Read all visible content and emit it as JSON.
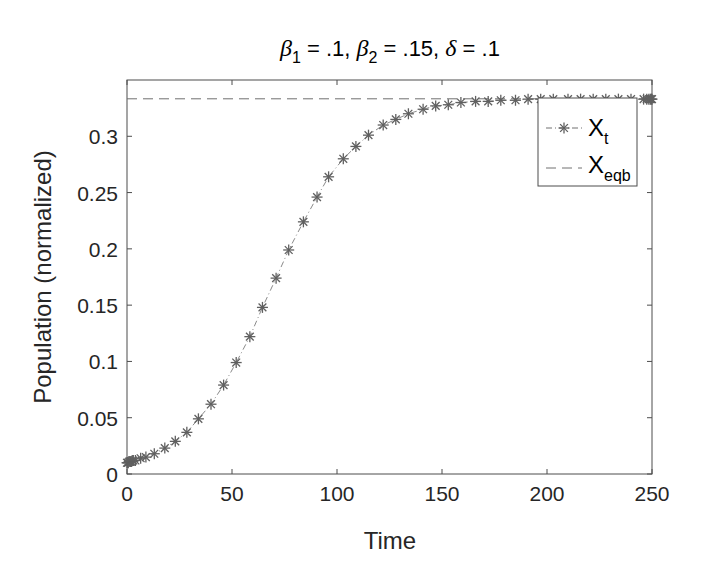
{
  "chart_data": {
    "type": "line",
    "title": "β1 = .1, β2 = .15, δ = .1",
    "title_parts": {
      "beta1_symbol": "β",
      "beta1_sub": "1",
      "beta1_value": " = .1, ",
      "beta2_symbol": "β",
      "beta2_sub": "2",
      "beta2_value": " = .15, ",
      "delta_symbol": "δ",
      "delta_value": " = .1"
    },
    "xlabel": "Time",
    "ylabel": "Population (normalized)",
    "xlim": [
      0,
      250
    ],
    "ylim": [
      0,
      0.35
    ],
    "xticks": [
      0,
      50,
      100,
      150,
      200,
      250
    ],
    "xtick_labels": [
      "0",
      "50",
      "100",
      "150",
      "200",
      "250"
    ],
    "yticks": [
      0,
      0.05,
      0.1,
      0.15,
      0.2,
      0.25,
      0.3
    ],
    "ytick_labels": [
      "0",
      "0.05",
      "0.1",
      "0.15",
      "0.2",
      "0.25",
      "0.3"
    ],
    "grid": false,
    "legend_position": "northeast",
    "series": [
      {
        "name": "X_t",
        "label_main": "X",
        "label_sub": "t",
        "style": "dash-dot line with asterisk markers",
        "color": "#707070",
        "x": [
          0,
          0.3,
          0.6,
          1,
          1.5,
          2,
          2.5,
          3,
          4,
          6.5,
          9,
          13,
          18,
          23,
          28.5,
          34,
          40,
          46,
          52,
          58.5,
          64.5,
          71,
          77,
          84,
          90.5,
          96,
          103,
          109,
          115,
          122,
          128,
          134,
          141,
          147,
          153,
          159,
          166,
          172,
          178,
          185,
          191,
          197,
          203,
          210,
          216,
          222,
          228,
          234,
          240,
          246,
          247.5,
          248.5,
          249.2,
          249.7,
          250
        ],
        "values": [
          0.01,
          0.01,
          0.01,
          0.011,
          0.011,
          0.011,
          0.012,
          0.012,
          0.012,
          0.014,
          0.015,
          0.018,
          0.023,
          0.029,
          0.037,
          0.049,
          0.062,
          0.079,
          0.099,
          0.122,
          0.148,
          0.174,
          0.199,
          0.224,
          0.246,
          0.264,
          0.28,
          0.291,
          0.301,
          0.31,
          0.315,
          0.32,
          0.324,
          0.327,
          0.328,
          0.33,
          0.331,
          0.331,
          0.332,
          0.332,
          0.333,
          0.333,
          0.333,
          0.333,
          0.333,
          0.333,
          0.333,
          0.333,
          0.333,
          0.333,
          0.333,
          0.333,
          0.333,
          0.333,
          0.333
        ]
      },
      {
        "name": "X_eqb",
        "label_main": "X",
        "label_sub": "eqb",
        "style": "dashed line",
        "color": "#707070",
        "x": [
          0,
          250
        ],
        "values": [
          0.3333,
          0.3333
        ]
      }
    ]
  },
  "colors": {
    "axis": "#4d4d4d",
    "series": "#707070",
    "text": "#262626",
    "background": "#ffffff"
  }
}
